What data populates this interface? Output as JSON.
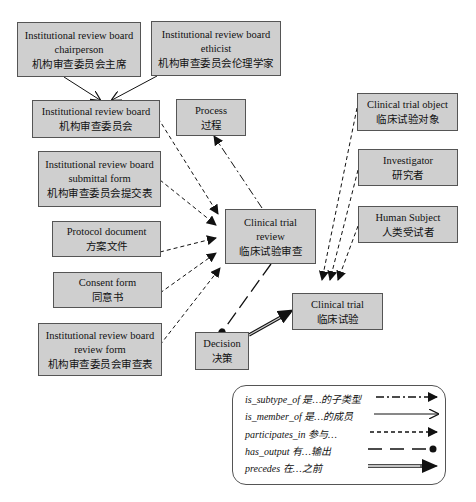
{
  "nodes": {
    "irb_chair": {
      "en1": "Institutional review board",
      "en2": "chairperson",
      "zh": "机构审查委员会主席"
    },
    "irb_ethicist": {
      "en1": "Institutional review board",
      "en2": "ethicist",
      "zh": "机构审查委员会伦理学家"
    },
    "irb": {
      "en1": "Institutional review board",
      "zh": "机构审查委员会"
    },
    "process": {
      "en1": "Process",
      "zh": "过程"
    },
    "irb_submittal": {
      "en1": "Institutional review board",
      "en2": "submittal form",
      "zh": "机构审查委员会提交表"
    },
    "protocol": {
      "en1": "Protocol document",
      "zh": "方案文件"
    },
    "consent": {
      "en1": "Consent form",
      "zh": "同意书"
    },
    "irb_review_form": {
      "en1": "Institutional review board",
      "en2": "review form",
      "zh": "机构审查委员会审查表"
    },
    "ct_review": {
      "en1": "Clinical trial",
      "en2": "review",
      "zh": "临床试验审查"
    },
    "decision": {
      "en1": "Decision",
      "zh": "决策"
    },
    "clinical_trial": {
      "en1": "Clinical trial",
      "zh": "临床试验"
    },
    "ct_object": {
      "en1": "Clinical trial object",
      "zh": "临床试验对象"
    },
    "investigator": {
      "en1": "Investigator",
      "zh": "研究者"
    },
    "human_subject": {
      "en1": "Human Subject",
      "zh": "人类受试者"
    }
  },
  "legend": [
    {
      "label": "is_subtype_of 是…的子类型",
      "style": "dash-dot-arrow"
    },
    {
      "label": "is_member_of 是…的成员",
      "style": "solid-open-arrow"
    },
    {
      "label": "participates_in 参与…",
      "style": "dashed-filled-arrow"
    },
    {
      "label": "has_output 有…输出",
      "style": "long-dash-dot-end"
    },
    {
      "label": "precedes 在…之前",
      "style": "double-line-arrow"
    }
  ],
  "colors": {
    "node_fill": "#cfcfcf",
    "node_border": "#555555",
    "line": "#111111"
  }
}
